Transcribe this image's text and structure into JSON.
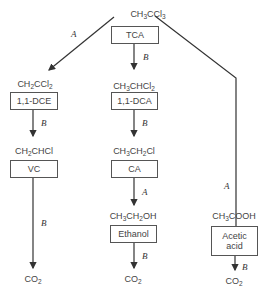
{
  "root": {
    "formula_parts": [
      "CH",
      "3",
      "CCl",
      "3"
    ],
    "abbrev": "TCA"
  },
  "branches": {
    "left": {
      "pathway_label": "A",
      "steps": [
        {
          "formula_parts": [
            "CH",
            "2",
            "CCl",
            "2"
          ],
          "abbrev": "1,1-DCE"
        },
        {
          "formula_parts": [
            "CH",
            "2",
            "CHCl",
            ""
          ],
          "abbrev": "VC"
        }
      ],
      "step_labels": [
        "B",
        "B"
      ],
      "end": {
        "formula_parts": [
          "CO",
          "2"
        ]
      }
    },
    "middle": {
      "steps": [
        {
          "formula_parts": [
            "CH",
            "3",
            "CHCl",
            "2"
          ],
          "abbrev": "1,1-DCA"
        },
        {
          "formula_parts": [
            "CH",
            "3",
            "CH",
            "2",
            "Cl"
          ],
          "abbrev": "CA"
        },
        {
          "formula_parts": [
            "CH",
            "3",
            "CH",
            "2",
            "OH"
          ],
          "abbrev": "Ethanol"
        }
      ],
      "step_labels": [
        "B",
        "B",
        "A",
        "B"
      ],
      "end": {
        "formula_parts": [
          "CO",
          "2"
        ]
      }
    },
    "right": {
      "pathway_label": "A",
      "steps": [
        {
          "formula_parts": [
            "CH",
            "3",
            "COOH"
          ],
          "abbrev_line1": "Acetic",
          "abbrev_line2": "acid"
        }
      ],
      "step_labels": [
        "B"
      ],
      "end": {
        "formula_parts": [
          "CO",
          "2"
        ]
      }
    }
  },
  "colors": {
    "line": "#333333",
    "box_border": "#555555",
    "text": "#444444"
  }
}
